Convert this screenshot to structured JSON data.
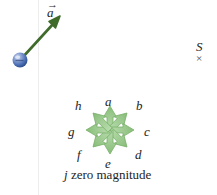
{
  "figure": {
    "background_color": "#ffffff",
    "guide_line_color": "#ededed",
    "vector_a": {
      "label": "a",
      "vector_arrow_glyph": "→",
      "color": "#3f6b2b",
      "ball_color": "#4a6fb5",
      "tail": {
        "x": 22,
        "y": 58
      },
      "tip": {
        "x": 60,
        "y": 17
      },
      "label_x": 47,
      "label_y": 6
    },
    "star": {
      "center": {
        "x": 110,
        "y": 130
      },
      "arrow_fill": "#9fcb92",
      "arrow_stroke": "#7ab06b",
      "radius": 24,
      "arrows": [
        {
          "name": "a",
          "label": "a",
          "angle_deg": 90,
          "label_x": 105,
          "label_y": 95
        },
        {
          "name": "b",
          "label": "b",
          "angle_deg": 45,
          "label_x": 136,
          "label_y": 99
        },
        {
          "name": "c",
          "label": "c",
          "angle_deg": 0,
          "label_x": 144,
          "label_y": 125
        },
        {
          "name": "d",
          "label": "d",
          "angle_deg": -45,
          "label_x": 135,
          "label_y": 148
        },
        {
          "name": "e",
          "label": "e",
          "angle_deg": -90,
          "label_x": 105,
          "label_y": 157
        },
        {
          "name": "f",
          "label": "f",
          "angle_deg": 225,
          "label_x": 77,
          "label_y": 148
        },
        {
          "name": "g",
          "label": "g",
          "angle_deg": 180,
          "label_x": 68,
          "label_y": 125
        },
        {
          "name": "h",
          "label": "h",
          "angle_deg": 135,
          "label_x": 75,
          "label_y": 99
        }
      ]
    },
    "caption": {
      "symbol": "j",
      "text": "zero magnitude"
    },
    "side_mark": {
      "letter": "S",
      "glyph": "×"
    }
  }
}
